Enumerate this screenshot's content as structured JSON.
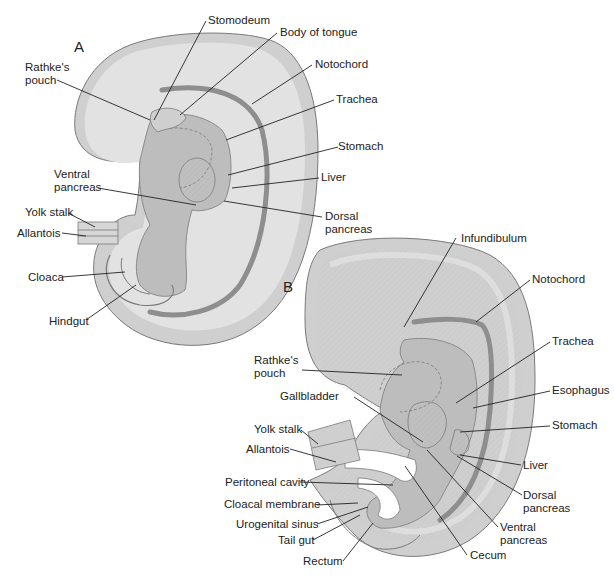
{
  "figure": {
    "panels": [
      {
        "id": "A",
        "label": "A",
        "structures": [
          {
            "name": "Stomodeum",
            "label": "Stomodeum"
          },
          {
            "name": "Body of tongue",
            "label": "Body of tongue"
          },
          {
            "name": "Rathke's pouch",
            "label_lines": [
              "Rathke's",
              "pouch"
            ]
          },
          {
            "name": "Notochord",
            "label": "Notochord"
          },
          {
            "name": "Trachea",
            "label": "Trachea"
          },
          {
            "name": "Stomach",
            "label": "Stomach"
          },
          {
            "name": "Ventral pancreas",
            "label_lines": [
              "Ventral",
              "pancreas"
            ]
          },
          {
            "name": "Liver",
            "label": "Liver"
          },
          {
            "name": "Dorsal pancreas",
            "label_lines": [
              "Dorsal",
              "pancreas"
            ]
          },
          {
            "name": "Yolk stalk",
            "label": "Yolk stalk"
          },
          {
            "name": "Allantois",
            "label": "Allantois"
          },
          {
            "name": "Cloaca",
            "label": "Cloaca"
          },
          {
            "name": "Hindgut",
            "label": "Hindgut"
          }
        ]
      },
      {
        "id": "B",
        "label": "B",
        "structures": [
          {
            "name": "Infundibulum",
            "label": "Infundibulum"
          },
          {
            "name": "Notochord",
            "label": "Notochord"
          },
          {
            "name": "Rathke's pouch",
            "label_lines": [
              "Rathke's",
              "pouch"
            ]
          },
          {
            "name": "Trachea",
            "label": "Trachea"
          },
          {
            "name": "Gallbladder",
            "label": "Gallbladder"
          },
          {
            "name": "Esophagus",
            "label": "Esophagus"
          },
          {
            "name": "Yolk stalk",
            "label": "Yolk stalk"
          },
          {
            "name": "Stomach",
            "label": "Stomach"
          },
          {
            "name": "Allantois",
            "label": "Allantois"
          },
          {
            "name": "Liver",
            "label": "Liver"
          },
          {
            "name": "Peritoneal cavity",
            "label": "Peritoneal cavity"
          },
          {
            "name": "Dorsal pancreas",
            "label_lines": [
              "Dorsal",
              "pancreas"
            ]
          },
          {
            "name": "Cloacal membrane",
            "label": "Cloacal membrane"
          },
          {
            "name": "Urogenital sinus",
            "label": "Urogenital sinus"
          },
          {
            "name": "Ventral pancreas",
            "label_lines": [
              "Ventral",
              "pancreas"
            ]
          },
          {
            "name": "Tail gut",
            "label": "Tail gut"
          },
          {
            "name": "Cecum",
            "label": "Cecum"
          },
          {
            "name": "Rectum",
            "label": "Rectum"
          }
        ]
      }
    ],
    "colors": {
      "outer_layer": "#cfcfcf",
      "body_fill": "#e2e2e2",
      "inner_fill": "#bdbdbd",
      "notochord": "#8e8e8e",
      "cavity": "#ffffff",
      "outline": "#7a7a7a",
      "leader_line": "#222222",
      "label_text": "#222222"
    }
  }
}
